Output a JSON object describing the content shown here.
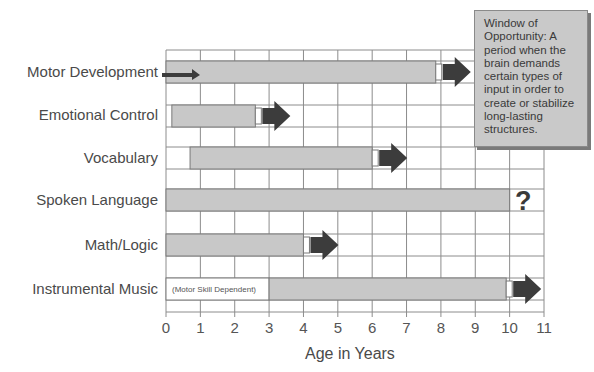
{
  "chart_data": {
    "type": "bar",
    "subtype": "horizontal-range-gantt",
    "title": "",
    "xlabel": "Age in Years",
    "ylabel": "",
    "xlim": [
      0,
      11
    ],
    "x_ticks": [
      "0",
      "1",
      "2",
      "3",
      "4",
      "5",
      "6",
      "7",
      "8",
      "9",
      "10",
      "11"
    ],
    "grid": true,
    "categories": [
      "Motor Development",
      "Emotional Control",
      "Vocabulary",
      "Spoken Language",
      "Math/Logic",
      "Instrumental Music"
    ],
    "series": [
      {
        "name": "Window of Opportunity",
        "values": [
          {
            "category": "Motor Development",
            "start": 0,
            "end": 7.85,
            "continues_arrow": true,
            "prenatal_arrow": true
          },
          {
            "category": "Emotional Control",
            "start": 0.17,
            "end": 2.6,
            "continues_arrow": true
          },
          {
            "category": "Vocabulary",
            "start": 0.7,
            "end": 6.0,
            "continues_arrow": true
          },
          {
            "category": "Spoken Language",
            "start": 0,
            "end": 10.0,
            "continues_arrow": false,
            "annotation": "?"
          },
          {
            "category": "Math/Logic",
            "start": 0,
            "end": 4.0,
            "continues_arrow": true
          },
          {
            "category": "Instrumental Music",
            "start": 3.0,
            "end": 9.9,
            "continues_arrow": true,
            "pre_note": "(Motor Skill Dependent)",
            "pre_note_start": 0
          }
        ]
      }
    ],
    "annotations": [
      "Window of Opportunity:  A period when the brain demands certain types of input in order to create or stabilize long-lasting structures.",
      "?"
    ]
  },
  "labels": {
    "rows": [
      "Motor Development",
      "Emotional Control",
      "Vocabulary",
      "Spoken Language",
      "Math/Logic",
      "Instrumental Music"
    ],
    "xlabel": "Age in Years",
    "ticks": [
      "0",
      "1",
      "2",
      "3",
      "4",
      "5",
      "6",
      "7",
      "8",
      "9",
      "10",
      "11"
    ],
    "instrumental_note": "(Motor Skill Dependent)",
    "question": "?",
    "note_lines": [
      "Window of",
      "Opportunity:  A",
      "period when the",
      "brain demands",
      "certain types of",
      "input in order to",
      "create or stabilize",
      "long-lasting",
      "structures."
    ]
  },
  "colors": {
    "bar_fill": "#c8c8c8",
    "bar_border": "#7a7a7a",
    "arrow": "#3c3c3c",
    "grid": "#8c8c8c",
    "text": "#4a4a4a",
    "note_fill": "#c9c9c9"
  }
}
